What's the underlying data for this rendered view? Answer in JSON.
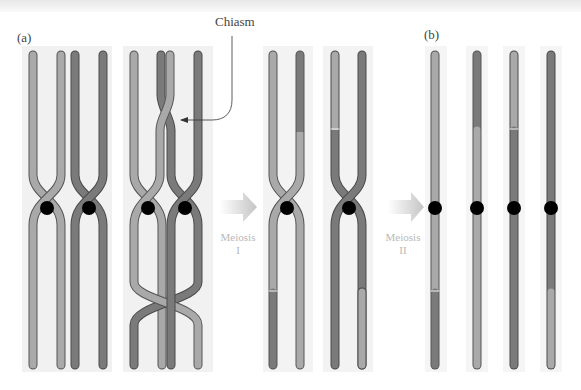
{
  "figure": {
    "panel_a_label": "(a)",
    "panel_b_label": "(b)",
    "chiasm_label": "Chiasm",
    "arrow1_label_line1": "Meiosis",
    "arrow1_label_line2": "I",
    "arrow2_label_line1": "Meiosis",
    "arrow2_label_line2": "II"
  },
  "colors": {
    "light_chromatid": "#a9a9a9",
    "dark_chromatid": "#7a7a7a",
    "outline": "#555555",
    "centromere": "#000000",
    "panel_bg": "#f1f1f1",
    "arrow": "#cfcfcf"
  },
  "panels": [
    {
      "name": "homologs-paired",
      "chromatids": [
        "light",
        "light",
        "dark",
        "dark"
      ]
    },
    {
      "name": "crossing-over",
      "chromatids": [
        "light",
        "dark/light crossed",
        "light/dark crossed",
        "dark"
      ]
    },
    {
      "name": "after-meiosis-I-cell-1",
      "chromatids": [
        "light (dark bottom)",
        "dark top / light bottom"
      ]
    },
    {
      "name": "after-meiosis-I-cell-2",
      "chromatids": [
        "light top / dark bottom",
        "dark (light bottom)"
      ]
    },
    {
      "name": "after-meiosis-II",
      "chromatids": [
        "light top, dark lower arm",
        "dark top segment, light rest",
        "light top segment, dark rest",
        "dark, light lower arm"
      ]
    }
  ]
}
